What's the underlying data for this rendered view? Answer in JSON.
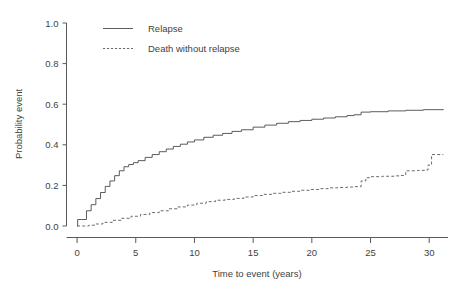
{
  "figure": {
    "background_color": "#ffffff",
    "line_color": "#4a4a4a",
    "text_color": "#3f3f3f"
  },
  "chart_data": {
    "type": "line",
    "title": "",
    "subtitle": "",
    "xlabel": "Time to event (years)",
    "ylabel": "Probability event",
    "xlim": [
      -0.9,
      31.6
    ],
    "ylim": [
      0.0,
      1.0
    ],
    "xticks": [
      0,
      5,
      10,
      15,
      20,
      25,
      30
    ],
    "xticklabels": [
      "0",
      "5",
      "10",
      "15",
      "20",
      "25",
      "30"
    ],
    "yticks": [
      0.0,
      0.2,
      0.4,
      0.6,
      0.8,
      1.0
    ],
    "yticklabels": [
      "0.0",
      "0.2",
      "0.4",
      "0.6",
      "0.8",
      "1.0"
    ],
    "grid": false,
    "legend_position": "upper left inside",
    "legend": [
      {
        "label": "Relapse",
        "style": "solid"
      },
      {
        "label": "Death without relapse",
        "style": "dashed"
      }
    ],
    "series": [
      {
        "name": "Relapse",
        "style": "solid",
        "x": [
          0.0,
          0.05,
          0.4,
          0.8,
          1.2,
          1.6,
          2.0,
          2.4,
          2.8,
          3.2,
          3.6,
          4.0,
          4.4,
          4.8,
          5.2,
          5.8,
          6.4,
          7.0,
          7.6,
          8.2,
          8.8,
          9.4,
          10.0,
          10.8,
          11.6,
          12.4,
          13.2,
          14.0,
          15.0,
          16.0,
          17.0,
          18.0,
          19.0,
          20.0,
          21.0,
          22.0,
          23.0,
          23.6,
          24.2,
          25.0,
          26.5,
          28.0,
          29.5,
          31.2
        ],
        "y": [
          0.0,
          0.032,
          0.032,
          0.075,
          0.105,
          0.135,
          0.165,
          0.195,
          0.222,
          0.248,
          0.272,
          0.292,
          0.303,
          0.312,
          0.322,
          0.338,
          0.352,
          0.366,
          0.379,
          0.392,
          0.403,
          0.414,
          0.424,
          0.437,
          0.447,
          0.456,
          0.466,
          0.474,
          0.487,
          0.497,
          0.506,
          0.514,
          0.52,
          0.526,
          0.532,
          0.538,
          0.544,
          0.548,
          0.561,
          0.563,
          0.567,
          0.57,
          0.573,
          0.576
        ]
      },
      {
        "name": "Death without relapse",
        "style": "dashed",
        "x": [
          0.0,
          0.4,
          1.0,
          1.6,
          2.2,
          3.0,
          3.8,
          4.6,
          5.4,
          6.2,
          7.0,
          7.8,
          8.6,
          9.4,
          10.2,
          11.0,
          11.8,
          12.6,
          13.4,
          14.2,
          15.0,
          15.8,
          16.6,
          17.4,
          18.2,
          19.0,
          19.8,
          20.6,
          21.4,
          22.2,
          23.0,
          23.6,
          24.2,
          24.6,
          25.0,
          26.0,
          27.0,
          27.6,
          28.0,
          29.0,
          29.6,
          29.9,
          30.2,
          31.2
        ],
        "y": [
          0.0,
          0.0,
          0.004,
          0.01,
          0.018,
          0.028,
          0.038,
          0.048,
          0.057,
          0.066,
          0.075,
          0.085,
          0.094,
          0.103,
          0.112,
          0.12,
          0.127,
          0.131,
          0.136,
          0.143,
          0.15,
          0.156,
          0.161,
          0.166,
          0.171,
          0.176,
          0.18,
          0.184,
          0.188,
          0.19,
          0.192,
          0.194,
          0.222,
          0.238,
          0.243,
          0.245,
          0.247,
          0.249,
          0.272,
          0.274,
          0.276,
          0.3,
          0.352,
          0.352
        ]
      }
    ]
  }
}
